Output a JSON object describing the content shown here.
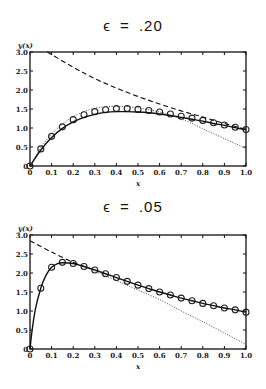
{
  "chart_data": [
    {
      "type": "line",
      "title": "ϵ = .20",
      "xlabel": "x",
      "ylabel": "y(x)",
      "xlim": [
        0,
        1.0
      ],
      "ylim": [
        0,
        3.0
      ],
      "xticks": [
        "0",
        "0.1",
        "0.2",
        "0.3",
        "0.4",
        "0.5",
        "0.6",
        "0.7",
        "0.8",
        "0.9",
        "1.0"
      ],
      "yticks": [
        "0",
        "0.5",
        "1.0",
        "1.5",
        "2.0",
        "2.5",
        "3.0"
      ],
      "grid": false,
      "series": [
        {
          "name": "exact (circles)",
          "style": "markers",
          "x": [
            0,
            0.05,
            0.1,
            0.15,
            0.2,
            0.25,
            0.3,
            0.35,
            0.4,
            0.45,
            0.5,
            0.55,
            0.6,
            0.65,
            0.7,
            0.75,
            0.8,
            0.85,
            0.9,
            0.95,
            1.0
          ],
          "y": [
            0,
            0.45,
            0.78,
            1.03,
            1.22,
            1.35,
            1.43,
            1.48,
            1.51,
            1.51,
            1.49,
            1.46,
            1.42,
            1.37,
            1.31,
            1.26,
            1.2,
            1.14,
            1.08,
            1.02,
            0.96
          ]
        },
        {
          "name": "uniform approximation",
          "style": "solid",
          "x": [
            0,
            0.05,
            0.1,
            0.15,
            0.2,
            0.25,
            0.3,
            0.35,
            0.4,
            0.45,
            0.5,
            0.55,
            0.6,
            0.65,
            0.7,
            0.75,
            0.8,
            0.85,
            0.9,
            0.95,
            1.0
          ],
          "y": [
            0,
            0.42,
            0.75,
            0.99,
            1.16,
            1.28,
            1.36,
            1.41,
            1.43,
            1.43,
            1.42,
            1.4,
            1.37,
            1.33,
            1.28,
            1.23,
            1.18,
            1.12,
            1.07,
            1.01,
            0.95
          ]
        },
        {
          "name": "outer solution",
          "style": "dashed",
          "x": [
            0.08,
            0.2,
            0.3,
            0.4,
            0.5,
            0.6,
            0.7,
            0.8,
            0.9,
            1.0
          ],
          "y": [
            3.0,
            2.6,
            2.3,
            2.05,
            1.83,
            1.63,
            1.45,
            1.29,
            1.12,
            0.96
          ]
        },
        {
          "name": "inner solution",
          "style": "dotted",
          "x": [
            0,
            0.05,
            0.1,
            0.15,
            0.2,
            0.25,
            0.3,
            0.35,
            0.4,
            0.45,
            0.5,
            0.55,
            0.6,
            0.65,
            0.7,
            0.75,
            0.8,
            0.85,
            0.9,
            0.95,
            1.0
          ],
          "y": [
            0,
            0.48,
            0.84,
            1.1,
            1.3,
            1.43,
            1.52,
            1.56,
            1.57,
            1.56,
            1.53,
            1.48,
            1.42,
            1.34,
            1.24,
            1.12,
            0.98,
            0.85,
            0.72,
            0.59,
            0.46
          ]
        }
      ]
    },
    {
      "type": "line",
      "title": "ϵ = .05",
      "xlabel": "x",
      "ylabel": "y(x)",
      "xlim": [
        0,
        1.0
      ],
      "ylim": [
        0,
        3.0
      ],
      "xticks": [
        "0",
        "0.1",
        "0.2",
        "0.3",
        "0.4",
        "0.5",
        "0.6",
        "0.7",
        "0.8",
        "0.9",
        "1.0"
      ],
      "yticks": [
        "0",
        "0.5",
        "1.0",
        "1.5",
        "2.0",
        "2.5",
        "3.0"
      ],
      "grid": false,
      "series": [
        {
          "name": "exact (circles)",
          "style": "markers",
          "x": [
            0,
            0.05,
            0.1,
            0.15,
            0.2,
            0.25,
            0.3,
            0.35,
            0.4,
            0.45,
            0.5,
            0.55,
            0.6,
            0.65,
            0.7,
            0.75,
            0.8,
            0.85,
            0.9,
            0.95,
            1.0
          ],
          "y": [
            0,
            1.6,
            2.15,
            2.28,
            2.25,
            2.17,
            2.08,
            1.98,
            1.88,
            1.78,
            1.68,
            1.59,
            1.5,
            1.42,
            1.34,
            1.27,
            1.2,
            1.14,
            1.08,
            1.03,
            0.97
          ]
        },
        {
          "name": "uniform approximation",
          "style": "solid",
          "x": [
            0,
            0.01,
            0.025,
            0.05,
            0.075,
            0.1,
            0.125,
            0.15,
            0.2,
            0.25,
            0.3,
            0.35,
            0.4,
            0.45,
            0.5,
            0.55,
            0.6,
            0.65,
            0.7,
            0.75,
            0.8,
            0.85,
            0.9,
            0.95,
            1.0
          ],
          "y": [
            0,
            0.5,
            1.05,
            1.6,
            1.95,
            2.15,
            2.24,
            2.27,
            2.25,
            2.17,
            2.08,
            1.98,
            1.88,
            1.78,
            1.68,
            1.59,
            1.5,
            1.42,
            1.34,
            1.27,
            1.2,
            1.14,
            1.08,
            1.03,
            0.97
          ]
        },
        {
          "name": "outer solution",
          "style": "dashed",
          "x": [
            0,
            0.1,
            0.2,
            0.25
          ],
          "y": [
            2.85,
            2.55,
            2.28,
            2.17
          ]
        },
        {
          "name": "inner solution",
          "style": "dotted",
          "x": [
            0.25,
            0.4,
            0.5,
            0.6,
            0.7,
            0.8,
            0.9,
            1.0
          ],
          "y": [
            2.17,
            1.8,
            1.55,
            1.3,
            1.0,
            0.72,
            0.42,
            0.12
          ]
        }
      ]
    }
  ]
}
